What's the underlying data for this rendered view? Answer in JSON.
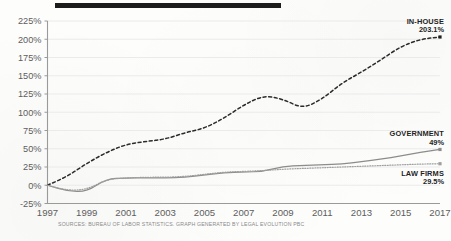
{
  "figure": {
    "top_rule_color": "#1c1c1c",
    "background_color": "#fdfdfc",
    "caption": "SOURCES: BUREAU OF LABOR STATISTICS. GRAPH GENERATED BY LEGAL EVOLUTION PBC"
  },
  "chart_data": {
    "type": "line",
    "title": "",
    "subtitle": "",
    "xlabel": "",
    "ylabel": "",
    "xlim": [
      1997,
      2017
    ],
    "ylim": [
      -25,
      225
    ],
    "ytick_labels": [
      "225%",
      "200%",
      "175%",
      "150%",
      "125%",
      "100%",
      "75%",
      "50%",
      "25%",
      "0%",
      "-25%"
    ],
    "ytick_values": [
      225,
      200,
      175,
      150,
      125,
      100,
      75,
      50,
      25,
      0,
      -25
    ],
    "xtick_labels": [
      "1997",
      "1999",
      "2001",
      "2003",
      "2005",
      "2007",
      "2009",
      "2011",
      "2013",
      "2015",
      "2017"
    ],
    "xtick_values": [
      1997,
      1999,
      2001,
      2003,
      2005,
      2007,
      2009,
      2011,
      2013,
      2015,
      2017
    ],
    "grid": true,
    "legend_position": "right-inline-labels",
    "x": [
      1997,
      1998,
      1999,
      2000,
      2001,
      2002,
      2003,
      2004,
      2005,
      2006,
      2007,
      2008,
      2009,
      2010,
      2011,
      2012,
      2013,
      2014,
      2015,
      2016,
      2017
    ],
    "series": [
      {
        "name": "IN-HOUSE",
        "style": "dashed",
        "color": "#2b2b2b",
        "end_label": "IN-HOUSE",
        "end_value_label": "203.1%",
        "end_value": 203.1,
        "values": [
          0,
          12,
          30,
          45,
          56,
          60,
          63,
          72,
          78,
          92,
          110,
          123,
          118,
          105,
          118,
          140,
          155,
          172,
          190,
          200,
          203.1
        ]
      },
      {
        "name": "GOVERNMENT",
        "style": "solid",
        "color": "#8c8c8c",
        "end_label": "GOVERNMENT",
        "end_value_label": "49%",
        "end_value": 49,
        "values": [
          0,
          -8,
          -9,
          9,
          10,
          10,
          10,
          11,
          14,
          17,
          18,
          19,
          26,
          27,
          28,
          29,
          32,
          36,
          40,
          45,
          49
        ]
      },
      {
        "name": "LAW FIRMS",
        "style": "dotted",
        "color": "#9f9f9f",
        "end_label": "LAW FIRMS",
        "end_value_label": "29.5%",
        "end_value": 29.5,
        "values": [
          0,
          -7,
          -6,
          8,
          10,
          11,
          11,
          12,
          15,
          18,
          19,
          20,
          22,
          23,
          24,
          25,
          26,
          27,
          28,
          29,
          29.5
        ]
      }
    ]
  }
}
